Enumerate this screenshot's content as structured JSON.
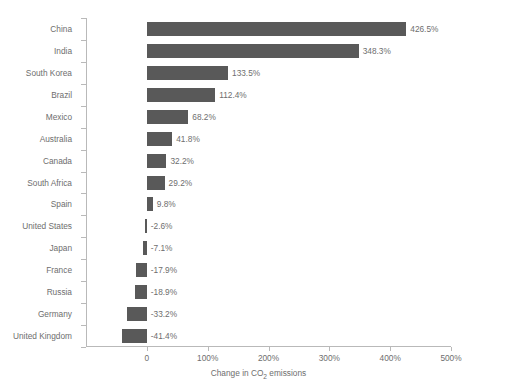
{
  "chart_data": {
    "type": "bar",
    "orientation": "horizontal",
    "title": "",
    "xlabel": "Change in CO₂ emissions",
    "ylabel": "",
    "xlim": [
      -100,
      500
    ],
    "xticks": [
      0,
      100,
      200,
      300,
      400,
      500
    ],
    "xtick_labels": [
      "0",
      "100%",
      "200%",
      "300%",
      "400%",
      "500%"
    ],
    "grid": false,
    "legend": null,
    "bar_color": "#595959",
    "axis_color": "#b9b9b9",
    "text_color": "#6e6e6e",
    "categories": [
      "China",
      "India",
      "South Korea",
      "Brazil",
      "Mexico",
      "Australia",
      "Canada",
      "South Africa",
      "Spain",
      "United States",
      "Japan",
      "France",
      "Russia",
      "Germany",
      "United Kingdom"
    ],
    "values": [
      426.5,
      348.3,
      133.5,
      112.4,
      68.2,
      41.8,
      32.2,
      29.2,
      9.8,
      -2.6,
      -7.1,
      -17.9,
      -18.9,
      -33.2,
      -41.4
    ],
    "value_labels": [
      "426.5%",
      "348.3%",
      "133.5%",
      "112.4%",
      "68.2%",
      "41.8%",
      "32.2%",
      "29.2%",
      "9.8%",
      "-2.6%",
      "-7.1%",
      "-17.9%",
      "-18.9%",
      "-33.2%",
      "-41.4%"
    ],
    "axis_title_parts": {
      "before": "Change in CO",
      "subscript": "2",
      "after": " emissions"
    }
  }
}
